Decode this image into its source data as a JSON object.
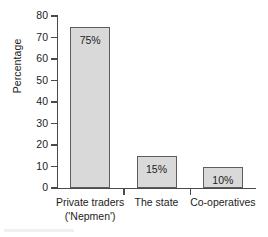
{
  "chart_data": {
    "type": "bar",
    "title": "",
    "subtitle": "",
    "xlabel": "",
    "ylabel": "Percentage",
    "ylim": [
      0,
      80
    ],
    "ytick_values": [
      0,
      10,
      20,
      30,
      40,
      50,
      60,
      70,
      80
    ],
    "ytick_labels": [
      "0",
      "10",
      "20",
      "30",
      "40",
      "50",
      "60",
      "70",
      "80"
    ],
    "grid": false,
    "legend": null,
    "categories": [
      "Private traders ('Nepmen')",
      "The state",
      "Co-operatives"
    ],
    "category_lines": [
      [
        "Private traders",
        "('Nepmen')"
      ],
      [
        "The state"
      ],
      [
        "Co-operatives"
      ]
    ],
    "values": [
      75,
      15,
      10
    ],
    "data_labels": [
      "75%",
      "15%",
      "10%"
    ],
    "bar_fill_color": "#d9d9d9",
    "bar_edge_color": "#5d5d5d",
    "axis_color": "#4a4a4a",
    "text_color": "#1c1c1c",
    "background_color": "#ffffff"
  }
}
